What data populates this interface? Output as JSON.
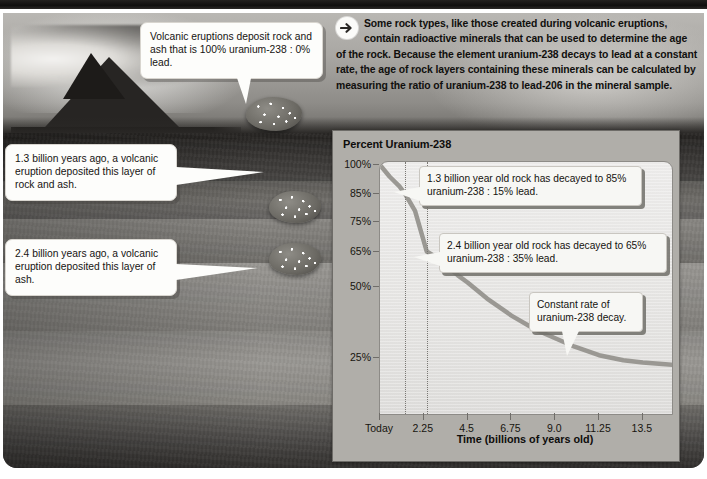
{
  "intro": {
    "icon": "arrow-right-circle-icon",
    "text": "Some rock types, like those created during volcanic eruptions, contain radioactive minerals that can be used to determine the age of the rock. Because the element uranium-238 decays to lead at a constant rate, the age of rock layers containing these minerals can be calculated by measuring the ratio of uranium-238 to lead-206 in the mineral sample."
  },
  "photo_callouts": [
    {
      "id": "eruption-deposit",
      "text": "Volcanic eruptions deposit rock and ash that is 100% uranium-238 : 0% lead."
    },
    {
      "id": "layer-1-3-billion",
      "text": "1.3 billion years ago, a volcanic eruption deposited this layer of rock and ash."
    },
    {
      "id": "layer-2-4-billion",
      "text": "2.4 billion years ago, a volcanic eruption deposited this layer of ash."
    }
  ],
  "chart_data": {
    "type": "line",
    "title": "Percent Uranium-238",
    "xlabel": "Time (billions of years old)",
    "ylabel": "Percent Uranium-238",
    "grid": false,
    "legend": "none",
    "xlim": [
      0,
      15.0
    ],
    "ylim": [
      0,
      100
    ],
    "xticks": [
      0,
      2.25,
      4.5,
      6.75,
      9.0,
      11.25,
      13.5
    ],
    "xticklabels": [
      "Today",
      "2.25",
      "4.5",
      "6.75",
      "9.0",
      "11.25",
      "13.5"
    ],
    "yticks": [
      100,
      85,
      75,
      65,
      50,
      25
    ],
    "yticklabels": [
      "100%",
      "85%",
      "75%",
      "65%",
      "50%",
      "25%"
    ],
    "series": [
      {
        "name": "Uranium-238 remaining",
        "color": "#9a9893",
        "x": [
          0,
          0.5,
          1.0,
          1.3,
          1.8,
          2.4,
          3.0,
          4.0,
          4.5,
          5.5,
          6.75,
          8.0,
          9.0,
          10.0,
          11.25,
          12.5,
          13.5,
          15.0
        ],
        "y": [
          100,
          94,
          89,
          85,
          79,
          65,
          62,
          55,
          52,
          46,
          40,
          35,
          32,
          29,
          26,
          24,
          23,
          22
        ]
      }
    ],
    "markers": [
      {
        "x": 1.3,
        "label": "1.3 billion years",
        "y": 85,
        "style": "dotted-vertical"
      },
      {
        "x": 2.4,
        "label": "2.4 billion years",
        "y": 65,
        "style": "dotted-vertical"
      }
    ],
    "annotations": [
      {
        "id": "annotation-1-3",
        "text": "1.3 billion year old rock has decayed to 85% uranium-238 : 15% lead."
      },
      {
        "id": "annotation-2-4",
        "text": "2.4 billion year old rock has decayed to 65% uranium-238 : 35% lead."
      },
      {
        "id": "annotation-constant-rate",
        "text": "Constant rate of uranium-238 decay."
      }
    ]
  },
  "colors": {
    "curve": "#9a9893",
    "panel": "#b0aea9",
    "plot_bg": "#edeceb",
    "callout_bg": "#f7f7f4",
    "text": "#15130f"
  }
}
